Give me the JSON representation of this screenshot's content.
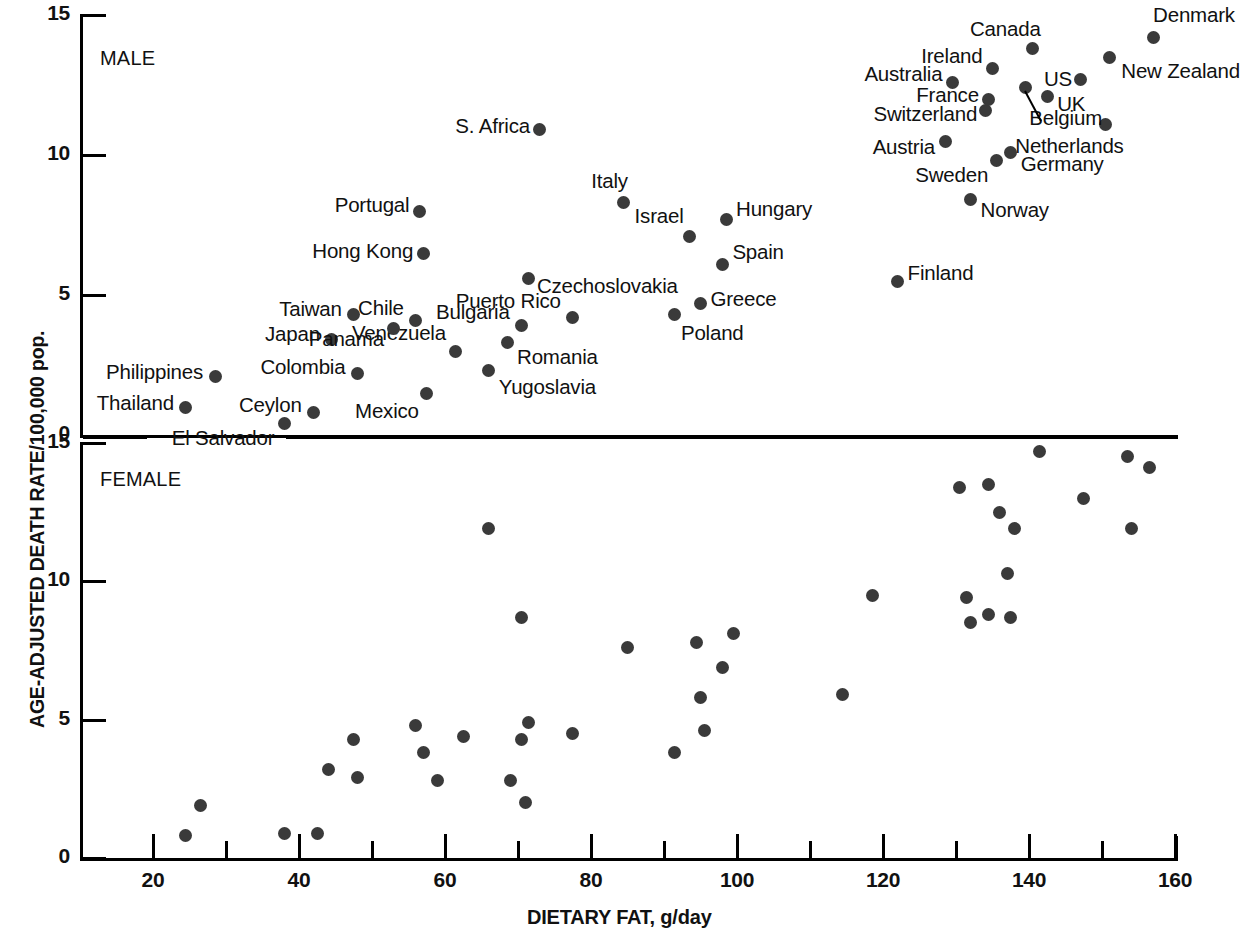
{
  "chart_data": {
    "type": "scatter",
    "title": "",
    "xlabel": "DIETARY FAT, g/day",
    "ylabel": "AGE-ADJUSTED DEATH RATE/100,000 pop.",
    "xlim": [
      10,
      160
    ],
    "ylim": [
      0,
      15
    ],
    "grid": false,
    "legend": "none",
    "x_ticks_major": [
      20,
      40,
      60,
      80,
      100,
      120,
      140,
      160
    ],
    "x_ticks_minor": [
      10,
      30,
      50,
      70,
      90,
      110,
      130,
      150
    ],
    "x_tick_labels": [
      "20",
      "40",
      "60",
      "80",
      "100",
      "120",
      "140",
      "160"
    ],
    "y_tick_labels": [
      "0",
      "5",
      "10",
      "15"
    ],
    "y_ticks": [
      0,
      5,
      10,
      15
    ],
    "panels": [
      {
        "name": "MALE",
        "points": [
          {
            "label": "El Salvador",
            "x": 38.0,
            "y": 0.4,
            "lbl_side": "r",
            "lbl_dx": -10,
            "lbl_dy": 14,
            "leader": true
          },
          {
            "label": "Thailand",
            "x": 24.5,
            "y": 1.0,
            "lbl_side": "r",
            "lbl_dx": -12,
            "lbl_dy": -4
          },
          {
            "label": "Ceylon",
            "x": 42.0,
            "y": 0.8,
            "lbl_side": "r",
            "lbl_dx": -12,
            "lbl_dy": -8
          },
          {
            "label": "Philippines",
            "x": 28.5,
            "y": 2.1,
            "lbl_side": "r",
            "lbl_dx": -12,
            "lbl_dy": -4
          },
          {
            "label": "Colombia",
            "x": 48.0,
            "y": 2.2,
            "lbl_side": "r",
            "lbl_dx": -12,
            "lbl_dy": -6
          },
          {
            "label": "Mexico",
            "x": 57.5,
            "y": 1.5,
            "lbl_side": "r",
            "lbl_dx": -8,
            "lbl_dy": 18
          },
          {
            "label": "Japan",
            "x": 44.5,
            "y": 3.4,
            "lbl_side": "r",
            "lbl_dx": -12,
            "lbl_dy": -6
          },
          {
            "label": "Taiwan",
            "x": 47.5,
            "y": 4.3,
            "lbl_side": "r",
            "lbl_dx": -12,
            "lbl_dy": -6
          },
          {
            "label": "Venezuela",
            "x": 61.5,
            "y": 3.0,
            "lbl_side": "r",
            "lbl_dx": -10,
            "lbl_dy": -18
          },
          {
            "label": "Yugoslavia",
            "x": 66.0,
            "y": 2.3,
            "lbl_side": "l",
            "lbl_dx": 10,
            "lbl_dy": 16
          },
          {
            "label": "Romania",
            "x": 68.5,
            "y": 3.3,
            "lbl_side": "l",
            "lbl_dx": 10,
            "lbl_dy": 14
          },
          {
            "label": "Panama",
            "x": 53.0,
            "y": 3.8,
            "lbl_side": "r",
            "lbl_dx": -10,
            "lbl_dy": 10
          },
          {
            "label": "Chile",
            "x": 56.0,
            "y": 4.1,
            "lbl_side": "r",
            "lbl_dx": -12,
            "lbl_dy": -12
          },
          {
            "label": "Bulgaria",
            "x": 70.5,
            "y": 3.9,
            "lbl_side": "r",
            "lbl_dx": -12,
            "lbl_dy": -14
          },
          {
            "label": "Puerto Rico",
            "x": 77.5,
            "y": 4.2,
            "lbl_side": "r",
            "lbl_dx": -12,
            "lbl_dy": -16
          },
          {
            "label": "Poland",
            "x": 91.5,
            "y": 4.3,
            "lbl_side": "l",
            "lbl_dx": 6,
            "lbl_dy": 18
          },
          {
            "label": "Greece",
            "x": 95.0,
            "y": 4.7,
            "lbl_side": "l",
            "lbl_dx": 10,
            "lbl_dy": -4
          },
          {
            "label": "Hong Kong",
            "x": 57.0,
            "y": 6.5,
            "lbl_side": "r",
            "lbl_dx": -10,
            "lbl_dy": -2
          },
          {
            "label": "Czechoslovakia",
            "x": 71.5,
            "y": 5.6,
            "lbl_side": "l",
            "lbl_dx": 8,
            "lbl_dy": 8
          },
          {
            "label": "Portugal",
            "x": 56.5,
            "y": 8.0,
            "lbl_side": "r",
            "lbl_dx": -10,
            "lbl_dy": -6
          },
          {
            "label": "Italy",
            "x": 84.5,
            "y": 8.3,
            "lbl_side": "r",
            "lbl_dx": 4,
            "lbl_dy": -22
          },
          {
            "label": "Israel",
            "x": 93.5,
            "y": 7.1,
            "lbl_side": "r",
            "lbl_dx": -6,
            "lbl_dy": -20
          },
          {
            "label": "Hungary",
            "x": 98.5,
            "y": 7.7,
            "lbl_side": "l",
            "lbl_dx": 10,
            "lbl_dy": -10
          },
          {
            "label": "Spain",
            "x": 98.0,
            "y": 6.1,
            "lbl_side": "l",
            "lbl_dx": 10,
            "lbl_dy": -12
          },
          {
            "label": "S. Africa",
            "x": 73.0,
            "y": 10.9,
            "lbl_side": "r",
            "lbl_dx": -10,
            "lbl_dy": -4
          },
          {
            "label": "Finland",
            "x": 122.0,
            "y": 5.5,
            "lbl_side": "l",
            "lbl_dx": 10,
            "lbl_dy": -8
          },
          {
            "label": "Norway",
            "x": 132.0,
            "y": 8.4,
            "lbl_side": "l",
            "lbl_dx": 10,
            "lbl_dy": 10
          },
          {
            "label": "Sweden",
            "x": 135.5,
            "y": 9.8,
            "lbl_side": "r",
            "lbl_dx": -8,
            "lbl_dy": 14
          },
          {
            "label": "Germany",
            "x": 137.5,
            "y": 10.1,
            "lbl_side": "l",
            "lbl_dx": 10,
            "lbl_dy": 12
          },
          {
            "label": "Austria",
            "x": 128.5,
            "y": 10.5,
            "lbl_side": "r",
            "lbl_dx": -10,
            "lbl_dy": 6
          },
          {
            "label": "Netherlands",
            "x": 150.5,
            "y": 11.1,
            "lbl_side": "r",
            "lbl_dx": 18,
            "lbl_dy": 22
          },
          {
            "label": "Switzerland",
            "x": 134.0,
            "y": 11.6,
            "lbl_side": "r",
            "lbl_dx": -8,
            "lbl_dy": 4
          },
          {
            "label": "France",
            "x": 134.5,
            "y": 12.0,
            "lbl_side": "r",
            "lbl_dx": -10,
            "lbl_dy": -4
          },
          {
            "label": "Belgium",
            "x": 139.5,
            "y": 12.4,
            "lbl_side": "l",
            "lbl_dx": 4,
            "lbl_dy": 30,
            "leader2": true
          },
          {
            "label": "UK",
            "x": 142.5,
            "y": 12.1,
            "lbl_side": "l",
            "lbl_dx": 10,
            "lbl_dy": 8
          },
          {
            "label": "Australia",
            "x": 129.5,
            "y": 12.6,
            "lbl_side": "r",
            "lbl_dx": -10,
            "lbl_dy": -8
          },
          {
            "label": "Ireland",
            "x": 135.0,
            "y": 13.1,
            "lbl_side": "r",
            "lbl_dx": -10,
            "lbl_dy": -12
          },
          {
            "label": "US",
            "x": 147.0,
            "y": 12.7,
            "lbl_side": "r",
            "lbl_dx": -8,
            "lbl_dy": 0
          },
          {
            "label": "Canada",
            "x": 140.5,
            "y": 13.8,
            "lbl_side": "r",
            "lbl_dx": 8,
            "lbl_dy": -20
          },
          {
            "label": "New Zealand",
            "x": 151.0,
            "y": 13.5,
            "lbl_side": "l",
            "lbl_dx": 12,
            "lbl_dy": 14
          },
          {
            "label": "Denmark",
            "x": 157.0,
            "y": 14.2,
            "lbl_side": "l",
            "lbl_dx": 0,
            "lbl_dy": -22
          }
        ]
      },
      {
        "name": "FEMALE",
        "points": [
          {
            "x": 24.5,
            "y": 0.8
          },
          {
            "x": 26.5,
            "y": 1.9
          },
          {
            "x": 38.0,
            "y": 0.9
          },
          {
            "x": 42.5,
            "y": 0.9
          },
          {
            "x": 44.0,
            "y": 3.2
          },
          {
            "x": 47.5,
            "y": 4.3
          },
          {
            "x": 48.0,
            "y": 2.9
          },
          {
            "x": 56.0,
            "y": 4.8
          },
          {
            "x": 57.0,
            "y": 3.8
          },
          {
            "x": 59.0,
            "y": 2.8
          },
          {
            "x": 62.5,
            "y": 4.4
          },
          {
            "x": 66.0,
            "y": 11.9
          },
          {
            "x": 69.0,
            "y": 2.8
          },
          {
            "x": 70.5,
            "y": 8.7
          },
          {
            "x": 70.5,
            "y": 4.3
          },
          {
            "x": 71.0,
            "y": 2.0
          },
          {
            "x": 71.5,
            "y": 4.9
          },
          {
            "x": 77.5,
            "y": 4.5
          },
          {
            "x": 85.0,
            "y": 7.6
          },
          {
            "x": 91.5,
            "y": 3.8
          },
          {
            "x": 94.5,
            "y": 7.8
          },
          {
            "x": 95.0,
            "y": 5.8
          },
          {
            "x": 95.5,
            "y": 4.6
          },
          {
            "x": 98.0,
            "y": 6.9
          },
          {
            "x": 99.5,
            "y": 8.1
          },
          {
            "x": 114.5,
            "y": 5.9
          },
          {
            "x": 118.5,
            "y": 9.5
          },
          {
            "x": 130.5,
            "y": 13.4
          },
          {
            "x": 131.5,
            "y": 9.4
          },
          {
            "x": 132.0,
            "y": 8.5
          },
          {
            "x": 134.5,
            "y": 13.5
          },
          {
            "x": 134.5,
            "y": 8.8
          },
          {
            "x": 136.0,
            "y": 12.5
          },
          {
            "x": 137.0,
            "y": 10.3
          },
          {
            "x": 137.5,
            "y": 8.7
          },
          {
            "x": 138.0,
            "y": 11.9
          },
          {
            "x": 141.5,
            "y": 14.7
          },
          {
            "x": 147.5,
            "y": 13.0
          },
          {
            "x": 153.5,
            "y": 14.5
          },
          {
            "x": 154.0,
            "y": 11.9
          },
          {
            "x": 156.5,
            "y": 14.1
          }
        ]
      }
    ]
  }
}
